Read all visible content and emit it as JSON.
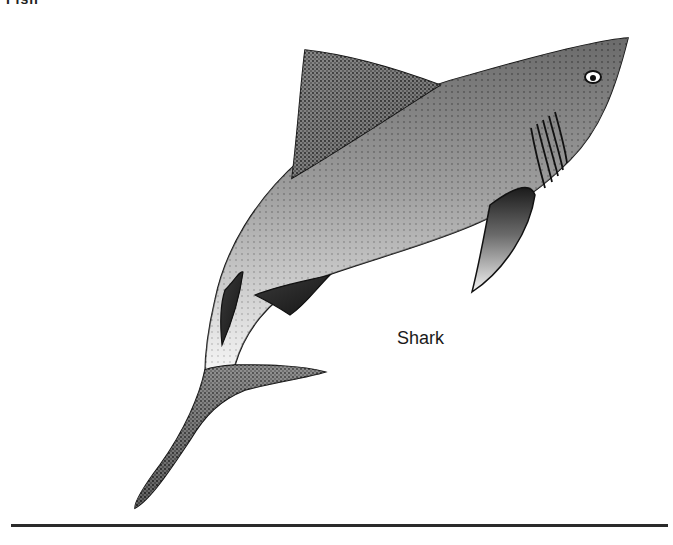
{
  "header": {
    "cropped_text": "Fish"
  },
  "illustration": {
    "subject": "shark",
    "style": "stipple pen-and-ink drawing",
    "ink_color": "#111111",
    "paper_color": "#ffffff"
  },
  "caption": {
    "label": "Shark"
  },
  "divider": {
    "color": "#2a2a2a"
  }
}
